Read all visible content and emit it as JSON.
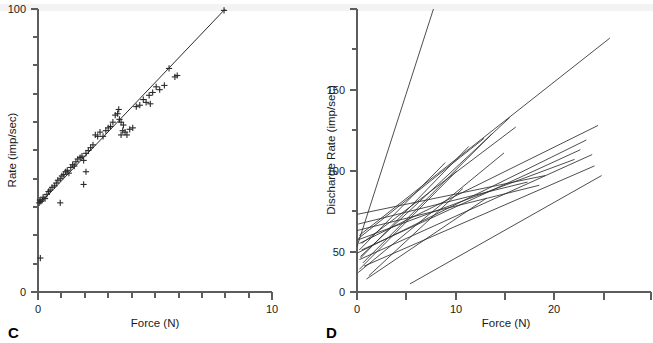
{
  "figure": {
    "panels": [
      {
        "id": "C",
        "label": "C",
        "axes": {
          "x": {
            "title": "Force (N)",
            "min": 0,
            "max": 10,
            "labeled_ticks": [
              {
                "value": 0,
                "text": "0"
              },
              {
                "value": 10,
                "text": "10"
              }
            ],
            "minor_tick_step": 1
          },
          "y": {
            "title": "Rate (imp/sec)",
            "min": 0,
            "max": 100,
            "labeled_ticks": [
              {
                "value": 0,
                "text": "0"
              },
              {
                "value": 100,
                "text": "100"
              }
            ],
            "minor_tick_step": 10
          }
        }
      },
      {
        "id": "D",
        "label": "D",
        "axes": {
          "x": {
            "title": "Force (N)",
            "min": 0,
            "max": 25,
            "labeled_ticks": [
              {
                "value": 0,
                "text": "0"
              },
              {
                "value": 10,
                "text": "10"
              },
              {
                "value": 20,
                "text": "20"
              }
            ],
            "minor_tick_step": 5
          },
          "y": {
            "title": "Discharge Rate (imp/sec)",
            "min": 0,
            "max": 175,
            "labeled_ticks": [
              {
                "value": 0,
                "text": "0"
              },
              {
                "value": 50,
                "text": "50"
              },
              {
                "value": 100,
                "text": "100"
              },
              {
                "value": 150,
                "text": "150"
              }
            ],
            "minor_tick_step": 25
          }
        }
      }
    ]
  },
  "chart_data": [
    {
      "type": "scatter",
      "panel": "C",
      "title": "",
      "xlabel": "Force (N)",
      "ylabel": "Rate (imp/sec)",
      "xlim": [
        0,
        10
      ],
      "ylim": [
        0,
        100
      ],
      "grid": false,
      "legend": "none",
      "marker": "plus",
      "series": [
        {
          "name": "Single unit discharge rate vs force",
          "x": [
            0.05,
            0.12,
            0.18,
            0.22,
            0.3,
            0.38,
            0.45,
            0.52,
            0.6,
            0.7,
            0.78,
            0.85,
            0.95,
            1.02,
            1.1,
            1.18,
            1.25,
            1.32,
            1.4,
            1.48,
            1.55,
            1.62,
            1.7,
            1.8,
            1.88,
            1.95,
            2.05,
            2.15,
            2.25,
            2.35,
            2.45,
            2.55,
            2.65,
            2.78,
            2.9,
            3.0,
            3.1,
            3.2,
            3.3,
            3.4,
            3.48,
            3.55,
            3.65,
            3.72,
            3.8,
            3.92,
            4.05,
            4.2,
            4.35,
            4.5,
            4.62,
            4.75,
            4.9,
            5.05,
            5.2,
            5.4,
            5.6,
            5.95,
            7.95,
            0.1,
            0.95,
            1.95,
            2.05,
            3.45,
            3.55,
            3.62,
            4.8,
            5.85,
            0.08
          ],
          "y": [
            31.5,
            32.0,
            32.5,
            33.5,
            33.0,
            34.5,
            35.5,
            36.0,
            37.0,
            37.5,
            38.5,
            39.5,
            40.0,
            41.0,
            41.5,
            42.5,
            43.0,
            42.0,
            44.0,
            45.0,
            44.5,
            46.0,
            47.0,
            47.5,
            48.0,
            46.5,
            49.0,
            50.0,
            51.0,
            52.0,
            55.5,
            55.0,
            56.5,
            55.0,
            57.0,
            58.0,
            58.5,
            60.0,
            62.5,
            63.0,
            61.0,
            60.0,
            59.0,
            56.5,
            55.5,
            57.5,
            58.0,
            65.5,
            66.0,
            68.0,
            67.0,
            69.5,
            70.5,
            72.5,
            71.5,
            73.0,
            79.0,
            76.5,
            99.5,
            12.0,
            31.5,
            38.0,
            42.5,
            64.5,
            55.5,
            57.0,
            66.5,
            76.0,
            32.5
          ],
          "n_points": 69
        }
      ],
      "fit_line": {
        "name": "least-squares fit",
        "x": [
          0.05,
          8.0
        ],
        "y": [
          31.0,
          100.0
        ]
      }
    },
    {
      "type": "line",
      "panel": "D",
      "title": "",
      "xlabel": "Force (N)",
      "ylabel": "Discharge Rate (imp/sec)",
      "xlim": [
        0,
        25
      ],
      "ylim": [
        0,
        175
      ],
      "grid": false,
      "legend": "none",
      "description": "Regression lines for individual motor units: discharge rate vs force",
      "lines": [
        {
          "name": "unit-1",
          "x": [
            0.0,
            6.5
          ],
          "y": [
            28.0,
            175.0
          ]
        },
        {
          "name": "unit-2",
          "x": [
            0.2,
            21.5
          ],
          "y": [
            35.0,
            157.0
          ]
        },
        {
          "name": "unit-3",
          "x": [
            0.3,
            13.0
          ],
          "y": [
            22.0,
            108.0
          ]
        },
        {
          "name": "unit-4",
          "x": [
            0.2,
            20.5
          ],
          "y": [
            30.0,
            103.0
          ]
        },
        {
          "name": "unit-5",
          "x": [
            0.5,
            11.5
          ],
          "y": [
            18.0,
            98.0
          ]
        },
        {
          "name": "unit-6",
          "x": [
            0.1,
            10.8
          ],
          "y": [
            33.0,
            95.0
          ]
        },
        {
          "name": "unit-7",
          "x": [
            0.0,
            19.5
          ],
          "y": [
            24.0,
            94.0
          ]
        },
        {
          "name": "unit-8",
          "x": [
            0.4,
            19.0
          ],
          "y": [
            26.0,
            88.0
          ]
        },
        {
          "name": "unit-9",
          "x": [
            0.2,
            20.0
          ],
          "y": [
            20.0,
            85.0
          ]
        },
        {
          "name": "unit-10",
          "x": [
            0.0,
            18.5
          ],
          "y": [
            32.0,
            82.0
          ]
        },
        {
          "name": "unit-11",
          "x": [
            0.6,
            20.2
          ],
          "y": [
            16.0,
            78.0
          ]
        },
        {
          "name": "unit-12",
          "x": [
            4.5,
            20.8
          ],
          "y": [
            5.0,
            72.0
          ]
        },
        {
          "name": "unit-13",
          "x": [
            0.1,
            14.5
          ],
          "y": [
            42.0,
            68.0
          ]
        },
        {
          "name": "unit-14",
          "x": [
            0.0,
            16.0
          ],
          "y": [
            48.0,
            72.0
          ]
        },
        {
          "name": "unit-15",
          "x": [
            0.3,
            9.5
          ],
          "y": [
            21.0,
            90.0
          ]
        },
        {
          "name": "unit-16",
          "x": [
            0.2,
            8.5
          ],
          "y": [
            14.0,
            75.0
          ]
        },
        {
          "name": "unit-17",
          "x": [
            0.1,
            12.5
          ],
          "y": [
            12.0,
            86.0
          ]
        },
        {
          "name": "unit-18",
          "x": [
            0.4,
            13.5
          ],
          "y": [
            30.0,
            102.0
          ]
        },
        {
          "name": "unit-19",
          "x": [
            1.0,
            9.0
          ],
          "y": [
            10.0,
            64.0
          ]
        },
        {
          "name": "unit-20",
          "x": [
            0.0,
            15.5
          ],
          "y": [
            38.0,
            66.0
          ]
        },
        {
          "name": "unit-21",
          "x": [
            0.2,
            7.5
          ],
          "y": [
            26.0,
            80.0
          ]
        },
        {
          "name": "unit-22",
          "x": [
            0.8,
            11.0
          ],
          "y": [
            8.0,
            58.0
          ]
        }
      ],
      "n_lines": 22
    }
  ]
}
